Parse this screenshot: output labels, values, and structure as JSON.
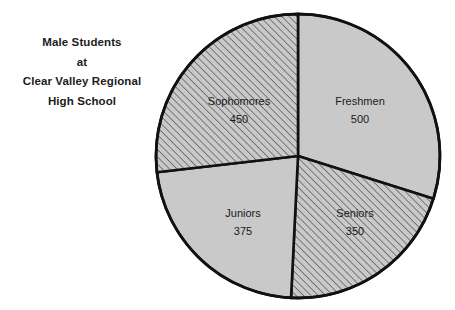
{
  "title": {
    "lines": [
      "Male Students",
      "at",
      "Clear Valley Regional",
      "High School"
    ],
    "full": "Male Students at Clear Valley Regional High School"
  },
  "colors": {
    "background": "#ffffff",
    "slice_fill": "#c9c9c9",
    "hatch_line": "#6a6a6a",
    "outline": "#111111",
    "text": "#1a1a1a"
  },
  "chart_data": {
    "type": "pie",
    "title": "Male Students at Clear Valley Regional High School",
    "xlabel": "",
    "ylabel": "",
    "grid": false,
    "legend": "none",
    "labels_inside_slices": true,
    "start_angle_deg": 0,
    "direction": "clockwise",
    "total": 1675,
    "categories": [
      "Freshmen",
      "Sophomores",
      "Juniors",
      "Seniors"
    ],
    "values": [
      500,
      450,
      375,
      350
    ],
    "slices": [
      {
        "label": "Freshmen",
        "value": 500,
        "value_text": "500",
        "fill": "solid",
        "start_deg": 0,
        "end_deg": 107.5,
        "label_x": 360,
        "label_y": 110
      },
      {
        "label": "Seniors",
        "value": 350,
        "value_text": "350",
        "fill": "hatched",
        "start_deg": 107.5,
        "end_deg": 182.8,
        "label_x": 355,
        "label_y": 222
      },
      {
        "label": "Juniors",
        "value": 375,
        "value_text": "375",
        "fill": "solid",
        "start_deg": 182.8,
        "end_deg": 263.4,
        "label_x": 243,
        "label_y": 222
      },
      {
        "label": "Sophomores",
        "value": 450,
        "value_text": "450",
        "fill": "hatched",
        "start_deg": 263.4,
        "end_deg": 360,
        "label_x": 239,
        "label_y": 110
      }
    ],
    "geometry": {
      "center_x": 298,
      "center_y": 156,
      "radius": 142
    }
  }
}
